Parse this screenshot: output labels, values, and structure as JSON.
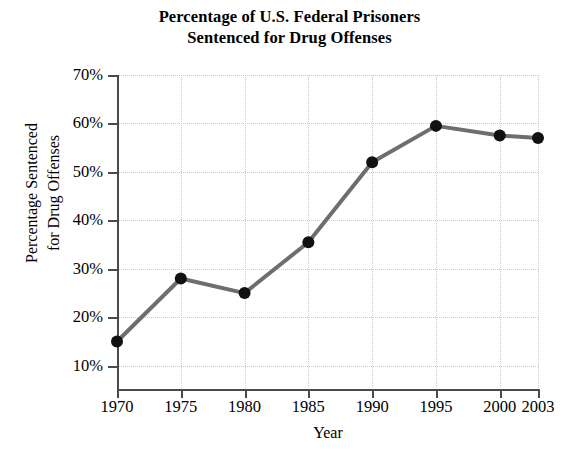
{
  "chart_data": {
    "type": "line",
    "title": "Percentage of U.S. Federal Prisoners Sentenced for Drug Offenses",
    "title_lines": [
      "Percentage of U.S. Federal Prisoners",
      "Sentenced for Drug Offenses"
    ],
    "xlabel": "Year",
    "ylabel": "Percentage Sentenced for Drug Offenses",
    "ylabel_lines": [
      "Percentage Sentenced",
      "for Drug Offenses"
    ],
    "x": [
      1970,
      1975,
      1980,
      1985,
      1990,
      1995,
      2000,
      2003
    ],
    "categories": [
      "1970",
      "1975",
      "1980",
      "1985",
      "1990",
      "1995",
      "2000",
      "2003"
    ],
    "values": [
      15,
      28,
      25,
      35.5,
      52,
      59.5,
      57.5,
      57
    ],
    "series": [
      {
        "name": "Percentage Sentenced for Drug Offenses",
        "values": [
          15,
          28,
          25,
          35.5,
          52,
          59.5,
          57.5,
          57
        ]
      }
    ],
    "ylim": [
      5,
      70
    ],
    "xlim": [
      1970,
      2003
    ],
    "ytick_values": [
      70,
      60,
      50,
      40,
      30,
      20,
      10
    ],
    "ytick_labels": [
      "70%",
      "60%",
      "50%",
      "40%",
      "30%",
      "20%",
      "10%"
    ],
    "xtick_values": [
      1970,
      1975,
      1980,
      1985,
      1990,
      1995,
      2000,
      2003
    ],
    "xtick_labels": [
      "1970",
      "1975",
      "1980",
      "1985",
      "1990",
      "1995",
      "2000",
      "2003"
    ],
    "grid": true,
    "legend": false,
    "legend_position": "none",
    "colors": {
      "line": "#6e6e6e",
      "marker": "#111111",
      "axis": "#4a4a4a",
      "grid": "#c9c9c9",
      "background": "#ffffff",
      "text": "#000000"
    }
  }
}
